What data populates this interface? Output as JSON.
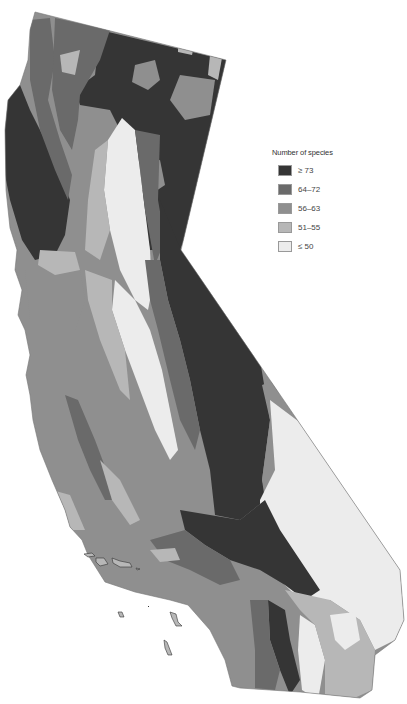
{
  "map": {
    "subject": "California",
    "metric": "Species richness"
  },
  "legend": {
    "title": "Number of species",
    "items": [
      {
        "label": "≥ 73",
        "color": "#353535",
        "class": "c1"
      },
      {
        "label": "64–72",
        "color": "#6a6a6a",
        "class": "c2"
      },
      {
        "label": "56–63",
        "color": "#8f8f8f",
        "class": "c3"
      },
      {
        "label": "51–55",
        "color": "#b7b7b7",
        "class": "c4"
      },
      {
        "label": "≤ 50",
        "color": "#ececec",
        "class": "c5"
      }
    ]
  },
  "colors": {
    "c1": "#353535",
    "c2": "#6a6a6a",
    "c3": "#8f8f8f",
    "c4": "#b7b7b7",
    "c5": "#ececec",
    "outline": "#777777"
  }
}
